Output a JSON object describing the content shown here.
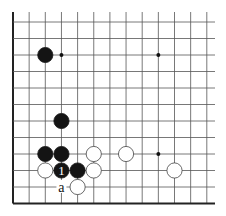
{
  "diagram": {
    "type": "go-board-fragment",
    "grid": {
      "columns": 13,
      "rows": 12,
      "origin_x": 13,
      "origin_y": 22,
      "spacing_x": 16.15,
      "spacing_y": 16.5,
      "top_extend_to": 12,
      "right_extend_to": 215,
      "edges": {
        "left": true,
        "bottom": true,
        "top": false,
        "right": false
      },
      "line_color": "#555555",
      "edge_color": "#222222"
    },
    "star_points": [
      {
        "col": 3,
        "row": 2
      },
      {
        "col": 9,
        "row": 2
      },
      {
        "col": 9,
        "row": 8
      }
    ],
    "stones": [
      {
        "color": "black",
        "col": 2,
        "row": 2
      },
      {
        "color": "black",
        "col": 3,
        "row": 6
      },
      {
        "color": "black",
        "col": 2,
        "row": 8
      },
      {
        "color": "black",
        "col": 3,
        "row": 8
      },
      {
        "color": "white",
        "col": 5,
        "row": 8
      },
      {
        "color": "white",
        "col": 7,
        "row": 8
      },
      {
        "color": "white",
        "col": 2,
        "row": 9
      },
      {
        "color": "black",
        "col": 3,
        "row": 9,
        "label": "1"
      },
      {
        "color": "black",
        "col": 4,
        "row": 9
      },
      {
        "color": "white",
        "col": 5,
        "row": 9
      },
      {
        "color": "white",
        "col": 10,
        "row": 9
      },
      {
        "color": "white",
        "col": 4,
        "row": 10
      }
    ],
    "point_labels": [
      {
        "col": 3,
        "row": 10,
        "text": "a"
      }
    ]
  }
}
